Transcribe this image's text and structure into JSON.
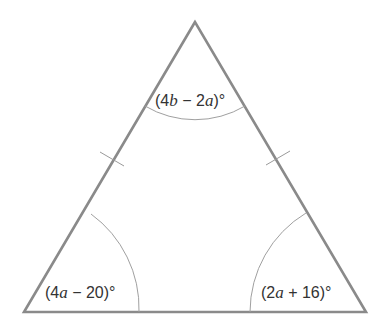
{
  "diagram": {
    "type": "isosceles-triangle",
    "colors": {
      "edge": "#8a8a8a",
      "arc": "#a0a0a0",
      "tick": "#9a9a9a",
      "text": "#333333"
    },
    "vertices": {
      "top": [
        195,
        22
      ],
      "bottom_left": [
        24,
        312
      ],
      "bottom_right": [
        366,
        312
      ]
    },
    "angles": {
      "top": {
        "prefix": "(4",
        "var1": "b",
        "mid": " − 2",
        "var2": "a",
        "suffix": ")°"
      },
      "bottom_left": {
        "prefix": "(4",
        "var1": "a",
        "suffix": " − 20)°"
      },
      "bottom_right": {
        "prefix": "(2",
        "var1": "a",
        "suffix": " + 16)°"
      }
    },
    "tick_marks": {
      "left_side": 1,
      "right_side": 1
    }
  }
}
